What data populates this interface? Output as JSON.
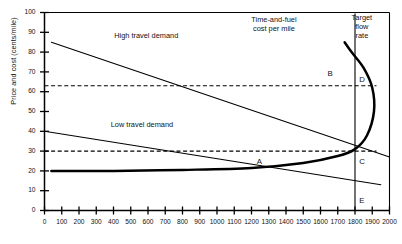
{
  "chart_data": {
    "type": "line",
    "title": "",
    "xlabel": "",
    "ylabel": "Price and cost (cents/mile)",
    "xlim": [
      0,
      2000
    ],
    "ylim": [
      0,
      100
    ],
    "xticks": [
      0,
      100,
      200,
      300,
      400,
      500,
      600,
      700,
      800,
      900,
      1000,
      1100,
      1200,
      1300,
      1400,
      1500,
      1600,
      1700,
      1800,
      1900,
      2000
    ],
    "yticks": [
      0,
      10,
      20,
      30,
      40,
      50,
      60,
      70,
      80,
      90,
      100
    ],
    "grid": false,
    "legend": "inline-annotations",
    "series": [
      {
        "name": "High travel demand",
        "style": "solid-thin",
        "x": [
          40,
          2000
        ],
        "y": [
          85,
          27
        ]
      },
      {
        "name": "Low travel demand",
        "style": "solid-thin",
        "x": [
          0,
          1950
        ],
        "y": [
          40,
          13
        ]
      },
      {
        "name": "Time-and-fuel cost per mile",
        "style": "solid-thick",
        "x": [
          40,
          400,
          800,
          1200,
          1500,
          1700,
          1800,
          1870,
          1910,
          1900,
          1850,
          1780,
          1740
        ],
        "y": [
          20,
          20,
          20.5,
          21.5,
          24,
          27.5,
          31,
          38,
          50,
          62,
          72,
          80,
          85
        ]
      }
    ],
    "reference_lines": [
      {
        "name": "high-equilibrium-price",
        "orientation": "horizontal",
        "value": 63,
        "style": "dashed"
      },
      {
        "name": "low-equilibrium-price",
        "orientation": "horizontal",
        "value": 30,
        "style": "dashed"
      },
      {
        "name": "target-flow-rate",
        "orientation": "vertical",
        "value": 1800,
        "style": "solid-thin"
      }
    ],
    "annotations": [
      {
        "name": "high-travel-demand-label",
        "text": "High travel demand",
        "x": 630,
        "y": 88
      },
      {
        "name": "low-travel-demand-label",
        "text": "Low travel demand",
        "x": 610,
        "y": 43
      },
      {
        "name": "time-and-fuel-cost-label",
        "text": "Time-and-fuel\ncost per mile",
        "x": 1330,
        "y": 96
      },
      {
        "name": "target-flow-rate-label",
        "text": "Target\nflow\nrate",
        "x": 1840,
        "y": 97
      }
    ],
    "point_labels": [
      {
        "name": "point-a",
        "text": "A",
        "x": 1230,
        "y": 24.5
      },
      {
        "name": "point-b",
        "text": "B",
        "x": 1640,
        "y": 69
      },
      {
        "name": "point-c",
        "text": "C",
        "x": 1825,
        "y": 24.5
      },
      {
        "name": "point-d",
        "text": "D",
        "x": 1825,
        "y": 66
      },
      {
        "name": "point-e",
        "text": "E",
        "x": 1825,
        "y": 5
      }
    ],
    "colors": {
      "axis": "#000000",
      "curve": "#000000",
      "background": "#ffffff"
    }
  }
}
